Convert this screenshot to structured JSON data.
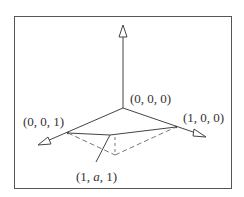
{
  "diagram": {
    "type": "3d-coordinate-axes",
    "labels": {
      "origin": "(0, 0, 0)",
      "x_axis_point": "(1, 0, 0)",
      "z_axis_point": "(0, 0, 1)",
      "point_prefix": "(1, ",
      "point_var": "a",
      "point_suffix": ", 1)"
    },
    "colors": {
      "line": "#444444",
      "dashed": "#777777",
      "frame": "#555555",
      "text": "#333333"
    }
  }
}
